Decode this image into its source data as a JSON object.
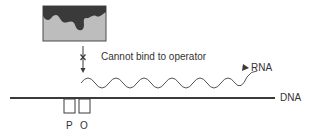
{
  "diagram": {
    "repressor": {
      "label": "",
      "fill": "#bdbdbd",
      "blob_fill": "#3a3a3a"
    },
    "blocked_binding": {
      "text": "Cannot bind to operator",
      "mark": "x"
    },
    "rna": {
      "label": "RNA"
    },
    "dna": {
      "label": "DNA"
    },
    "promoter": {
      "label": "P"
    },
    "operator": {
      "label": "O"
    }
  },
  "colors": {
    "line": "#3a3a3a",
    "text": "#333333",
    "rna_line": "#444444"
  }
}
